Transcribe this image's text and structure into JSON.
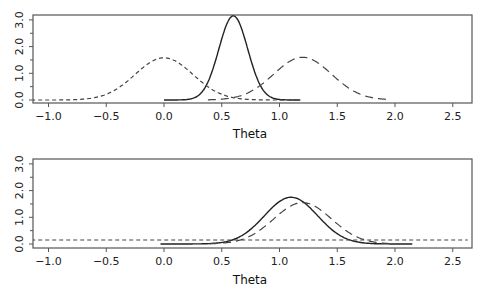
{
  "chart_data": [
    {
      "type": "line",
      "panel": "top",
      "title": "",
      "xlabel": "Theta",
      "ylabel": "",
      "xlim": [
        -1.15,
        2.63
      ],
      "ylim": [
        -0.12,
        3.2
      ],
      "xticks": [
        "-1.0",
        "-0.5",
        "0.0",
        "0.5",
        "1.0",
        "1.5",
        "2.0",
        "2.5"
      ],
      "yticks": [
        "0.0",
        "1.0",
        "2.0",
        "3.0"
      ],
      "grid": false,
      "legend": null,
      "series": [
        {
          "name": "solid",
          "style": "solid",
          "mean": 0.6,
          "sd": 0.125,
          "peak": 3.15,
          "x_range": [
            0.0,
            1.18
          ]
        },
        {
          "name": "short-dash",
          "style": "short-dash",
          "mean": 0.0,
          "sd": 0.25,
          "peak": 1.58,
          "x_range": [
            -1.15,
            1.18
          ]
        },
        {
          "name": "long-dash",
          "style": "long-dash",
          "mean": 1.2,
          "sd": 0.25,
          "peak": 1.6,
          "x_range": [
            0.38,
            1.95
          ]
        }
      ]
    },
    {
      "type": "line",
      "panel": "bottom",
      "title": "",
      "xlabel": "Theta",
      "ylabel": "",
      "xlim": [
        -1.15,
        2.63
      ],
      "ylim": [
        -0.12,
        3.2
      ],
      "xticks": [
        "-1.0",
        "-0.5",
        "0.0",
        "0.5",
        "1.0",
        "1.5",
        "2.0",
        "2.5"
      ],
      "yticks": [
        "0.0",
        "1.0",
        "2.0",
        "3.0"
      ],
      "grid": false,
      "legend": null,
      "series": [
        {
          "name": "solid",
          "style": "solid",
          "mean": 1.1,
          "sd": 0.23,
          "peak": 1.75,
          "x_range": [
            -0.03,
            2.15
          ]
        },
        {
          "name": "long-dash",
          "style": "long-dash",
          "mean": 1.2,
          "sd": 0.25,
          "peak": 1.55,
          "x_range": [
            0.4,
            1.95
          ]
        },
        {
          "name": "flat-dash",
          "style": "short-dash",
          "constant": 0.15,
          "x_range": [
            -1.15,
            2.63
          ]
        }
      ]
    }
  ]
}
